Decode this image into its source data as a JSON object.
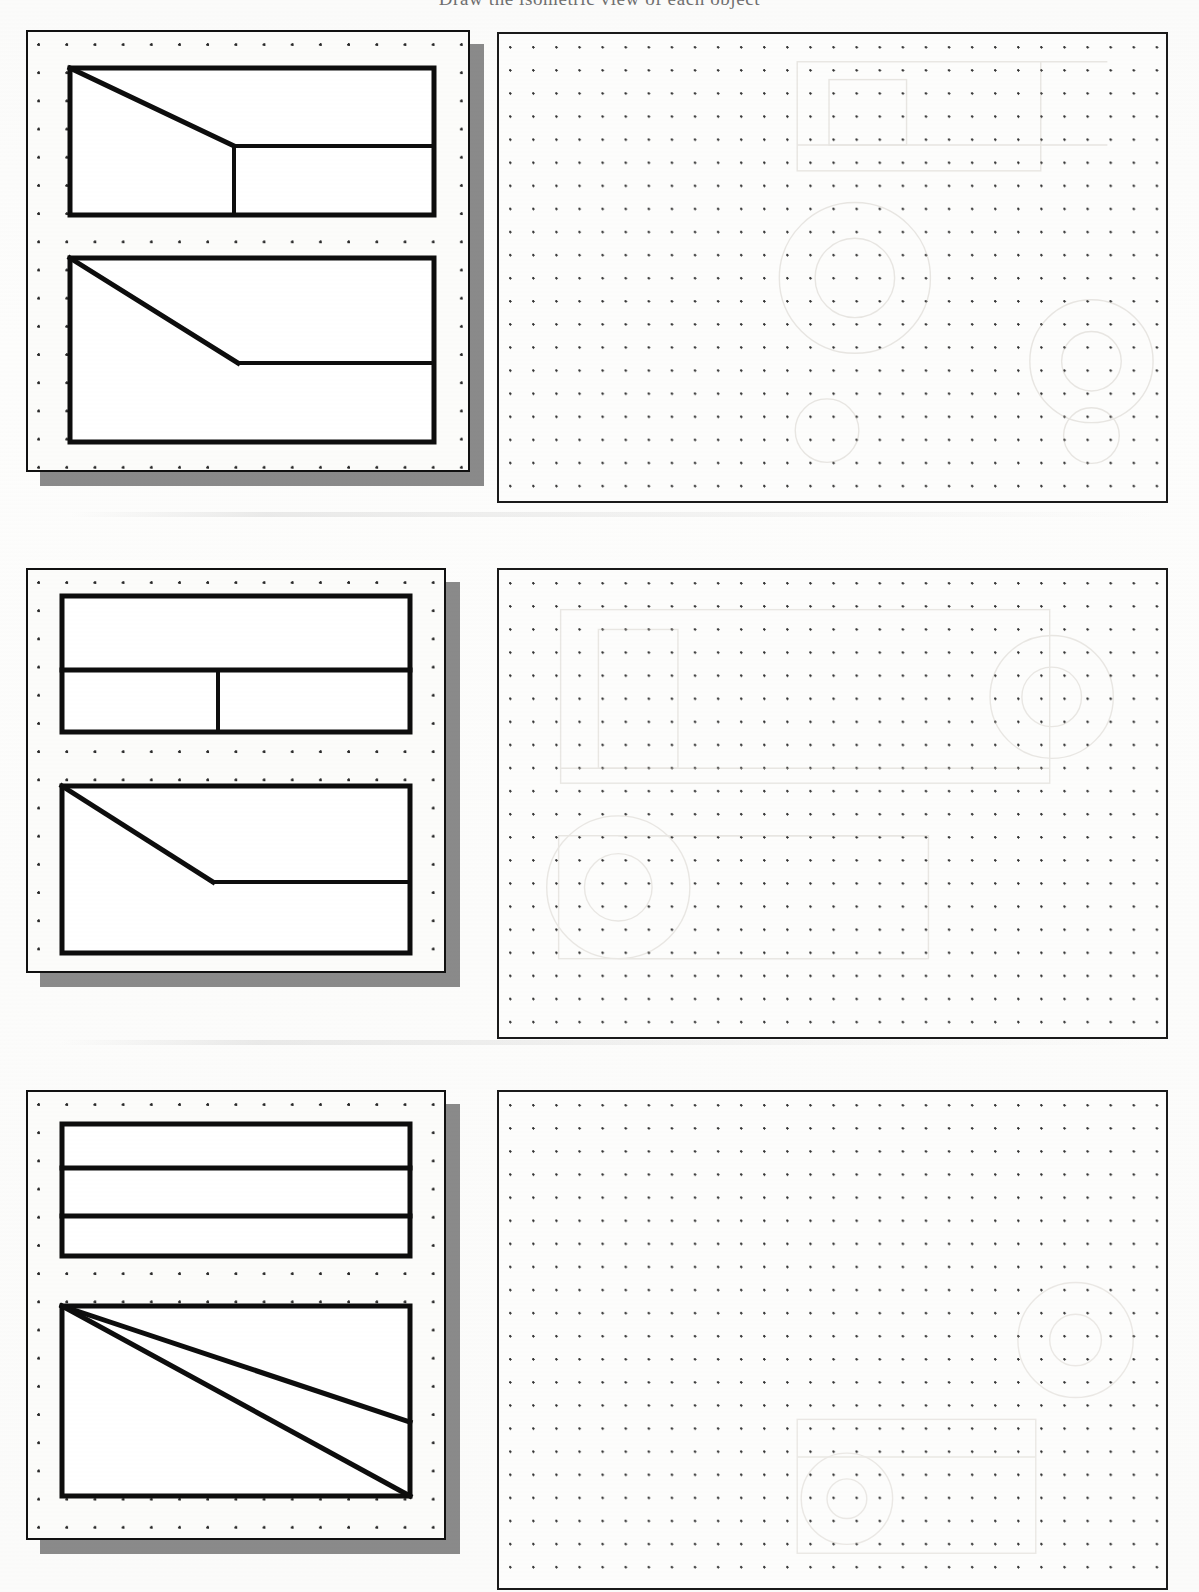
{
  "worksheet": {
    "title_cutoff": "Draw the isometric view of each object",
    "row_count": 3,
    "ink_color": "#0d0d0d",
    "paper_color": "#fcfcfa",
    "shadow_color": "#8a8a8a",
    "grid": {
      "given_dot_spacing_px": 28,
      "answer_dot_spacing_px": 23,
      "dot_color": "#2a2a2a"
    }
  },
  "problems": [
    {
      "number": "1",
      "given_label": "given-views-card-1",
      "answer_label": "isometric-answer-panel-1",
      "views": [
        {
          "name": "top-view",
          "type": "orthographic",
          "outline": "rectangle",
          "features": [
            "diagonal chamfer from top-left corner down to mid-right",
            "horizontal divider on lower-right portion"
          ]
        },
        {
          "name": "front-view",
          "type": "orthographic",
          "outline": "rectangle",
          "features": [
            "diagonal slope from top-left corner down to lower-middle",
            "horizontal line continuing from slope base to right edge"
          ]
        }
      ]
    },
    {
      "number": "2",
      "given_label": "given-views-card-2",
      "answer_label": "isometric-answer-panel-2",
      "views": [
        {
          "name": "top-view",
          "type": "orthographic",
          "outline": "rectangle",
          "features": [
            "horizontal divider across full width at upper third",
            "vertical divider in lower band at left of centre"
          ]
        },
        {
          "name": "front-view",
          "type": "orthographic",
          "outline": "rectangle",
          "features": [
            "diagonal slope from top-left corner down to lower-middle",
            "horizontal line continuing from slope base to right edge"
          ]
        }
      ]
    },
    {
      "number": "3",
      "given_label": "given-views-card-3",
      "answer_label": "isometric-answer-panel-3",
      "views": [
        {
          "name": "top-view",
          "type": "orthographic",
          "outline": "rectangle",
          "features": [
            "horizontal divider at one third height",
            "horizontal divider at two thirds height"
          ]
        },
        {
          "name": "front-view",
          "type": "orthographic",
          "outline": "rectangle",
          "features": [
            "diagonal from top-left corner to right edge at lower third",
            "diagonal from top-left corner to bottom-right corner"
          ]
        }
      ]
    }
  ]
}
